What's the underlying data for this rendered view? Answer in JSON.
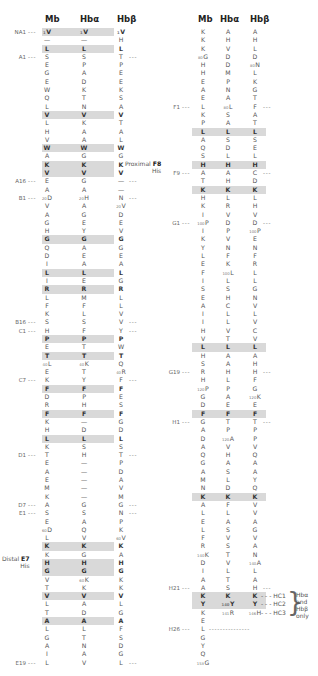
{
  "headers": {
    "mb": "Mb",
    "hba": "Hbα",
    "hbb": "Hbβ"
  },
  "left_rows": [
    {
      "label": "NA1",
      "mb": "V",
      "hba": "V",
      "hbb": "V",
      "shaded": true,
      "mb_num": "1",
      "hba_num": "1",
      "hbb_num": "1"
    },
    {
      "mb": "—",
      "hba": "—",
      "hbb": "H"
    },
    {
      "mb": "L",
      "hba": "L",
      "hbb": "L",
      "shaded": true
    },
    {
      "label": "A1",
      "mb": "S",
      "hba": "S",
      "hbb": "T",
      "right_dash": true
    },
    {
      "mb": "E",
      "hba": "P",
      "hbb": "P"
    },
    {
      "mb": "G",
      "hba": "A",
      "hbb": "E"
    },
    {
      "mb": "E",
      "hba": "D",
      "hbb": "E"
    },
    {
      "mb": "W",
      "hba": "K",
      "hbb": "K"
    },
    {
      "mb": "Q",
      "hba": "T",
      "hbb": "S"
    },
    {
      "mb": "L",
      "hba": "N",
      "hbb": "A"
    },
    {
      "mb": "V",
      "hba": "V",
      "hbb": "V",
      "shaded": true
    },
    {
      "mb": "L",
      "hba": "K",
      "hbb": "T"
    },
    {
      "mb": "H",
      "hba": "A",
      "hbb": "A"
    },
    {
      "mb": "V",
      "hba": "A",
      "hbb": "L"
    },
    {
      "mb": "W",
      "hba": "W",
      "hbb": "W",
      "shaded": true
    },
    {
      "mb": "A",
      "hba": "G",
      "hbb": "G"
    },
    {
      "mb": "K",
      "hba": "K",
      "hbb": "K",
      "shaded": true
    },
    {
      "mb": "V",
      "hba": "V",
      "hbb": "V",
      "shaded": true
    },
    {
      "label": "A16",
      "mb": "E",
      "hba": "G",
      "hbb": "—",
      "right_dash": true
    },
    {
      "mb": "A",
      "hba": "A",
      "hbb": "—"
    },
    {
      "label": "B1",
      "mb": "D",
      "hba": "H",
      "hbb": "N",
      "mb_num": "20",
      "hba_num": "20",
      "right_dash": true
    },
    {
      "mb": "V",
      "hba": "A",
      "hbb": "V",
      "hbb_num": "20"
    },
    {
      "mb": "A",
      "hba": "G",
      "hbb": "D"
    },
    {
      "mb": "G",
      "hba": "E",
      "hbb": "E"
    },
    {
      "mb": "H",
      "hba": "Y",
      "hbb": "V"
    },
    {
      "mb": "G",
      "hba": "G",
      "hbb": "G",
      "shaded": true
    },
    {
      "mb": "Q",
      "hba": "A",
      "hbb": "G"
    },
    {
      "mb": "D",
      "hba": "E",
      "hbb": "E"
    },
    {
      "mb": "I",
      "hba": "A",
      "hbb": "A"
    },
    {
      "mb": "L",
      "hba": "L",
      "hbb": "L",
      "shaded": true
    },
    {
      "mb": "I",
      "hba": "E",
      "hbb": "G"
    },
    {
      "mb": "R",
      "hba": "R",
      "hbb": "R",
      "shaded": true
    },
    {
      "mb": "L",
      "hba": "M",
      "hbb": "L"
    },
    {
      "mb": "F",
      "hba": "F",
      "hbb": "L"
    },
    {
      "mb": "K",
      "hba": "L",
      "hbb": "V"
    },
    {
      "label": "B16",
      "mb": "S",
      "hba": "S",
      "hbb": "V",
      "right_dash": true
    },
    {
      "label": "C1",
      "mb": "H",
      "hba": "F",
      "hbb": "Y",
      "right_dash": true
    },
    {
      "mb": "P",
      "hba": "P",
      "hbb": "P",
      "shaded": true
    },
    {
      "mb": "E",
      "hba": "T",
      "hbb": "W"
    },
    {
      "mb": "T",
      "hba": "T",
      "hbb": "T",
      "shaded": true
    },
    {
      "mb": "L",
      "hba": "K",
      "hbb": "Q",
      "mb_num": "40",
      "hba_num": "40"
    },
    {
      "mb": "E",
      "hba": "T",
      "hbb": "R",
      "hbb_num": "40"
    },
    {
      "label": "C7",
      "mb": "K",
      "hba": "Y",
      "hbb": "F",
      "right_dash": true
    },
    {
      "mb": "F",
      "hba": "F",
      "hbb": "F",
      "shaded": true
    },
    {
      "mb": "D",
      "hba": "P",
      "hbb": "E"
    },
    {
      "mb": "R",
      "hba": "H",
      "hbb": "S"
    },
    {
      "mb": "F",
      "hba": "F",
      "hbb": "F",
      "shaded": true
    },
    {
      "mb": "K",
      "hba": "—",
      "hbb": "G"
    },
    {
      "mb": "H",
      "hba": "D",
      "hbb": "D"
    },
    {
      "mb": "L",
      "hba": "L",
      "hbb": "L",
      "shaded": true
    },
    {
      "mb": "K",
      "hba": "S",
      "hbb": "S"
    },
    {
      "label": "D1",
      "mb": "T",
      "hba": "H",
      "hbb": "T",
      "right_dash": true
    },
    {
      "mb": "E",
      "hba": "—",
      "hbb": "P"
    },
    {
      "mb": "A",
      "hba": "—",
      "hbb": "D"
    },
    {
      "mb": "E",
      "hba": "—",
      "hbb": "A"
    },
    {
      "mb": "M",
      "hba": "—",
      "hbb": "V"
    },
    {
      "mb": "K",
      "hba": "—",
      "hbb": "M"
    },
    {
      "label": "D7",
      "mb": "A",
      "hba": "G",
      "hbb": "G",
      "right_dash": true
    },
    {
      "label": "E1",
      "mb": "S",
      "hba": "S",
      "hbb": "N",
      "right_dash": true
    },
    {
      "mb": "E",
      "hba": "A",
      "hbb": "P"
    },
    {
      "mb": "D",
      "hba": "Q",
      "hbb": "K",
      "mb_num": "60"
    },
    {
      "mb": "L",
      "hba": "V",
      "hbb": "V",
      "hbb_num": "60"
    },
    {
      "mb": "K",
      "hba": "K",
      "hbb": "K",
      "shaded": true
    },
    {
      "mb": "K",
      "hba": "G",
      "hbb": "A"
    },
    {
      "mb": "H",
      "hba": "H",
      "hbb": "H",
      "shaded": true,
      "special": "distal"
    },
    {
      "mb": "G",
      "hba": "G",
      "hbb": "G",
      "shaded": true
    },
    {
      "mb": "V",
      "hba": "K",
      "hbb": "K",
      "hba_num": "60"
    },
    {
      "mb": "T",
      "hba": "K",
      "hbb": "K"
    },
    {
      "mb": "V",
      "hba": "V",
      "hbb": "V",
      "shaded": true
    },
    {
      "mb": "L",
      "hba": "A",
      "hbb": "L"
    },
    {
      "mb": "T",
      "hba": "D",
      "hbb": "G"
    },
    {
      "mb": "A",
      "hba": "A",
      "hbb": "A",
      "shaded": true
    },
    {
      "mb": "L",
      "hba": "L",
      "hbb": "F"
    },
    {
      "mb": "G",
      "hba": "T",
      "hbb": "S"
    },
    {
      "mb": "A",
      "hba": "N",
      "hbb": "D"
    },
    {
      "mb": "I",
      "hba": "A",
      "hbb": "G"
    },
    {
      "label": "E19",
      "mb": "L",
      "hba": "V",
      "hbb": "L",
      "right_dash": true
    }
  ],
  "right_rows": [
    {
      "mb": "K",
      "hba": "A",
      "hbb": "A"
    },
    {
      "mb": "K",
      "hba": "H",
      "hbb": "H"
    },
    {
      "mb": "K",
      "hba": "V",
      "hbb": "L"
    },
    {
      "mb": "G",
      "hba": "D",
      "hbb": "D",
      "mb_num": "80"
    },
    {
      "mb": "H",
      "hba": "D",
      "hbb": "N",
      "hbb_num": "80"
    },
    {
      "mb": "H",
      "hba": "M",
      "hbb": "L"
    },
    {
      "mb": "E",
      "hba": "P",
      "hbb": "K"
    },
    {
      "mb": "A",
      "hba": "N",
      "hbb": "G"
    },
    {
      "mb": "E",
      "hba": "A",
      "hbb": "T"
    },
    {
      "label": "F1",
      "mb": "L",
      "hba": "L",
      "hbb": "F",
      "hba_num": "80",
      "right_dash": true
    },
    {
      "mb": "K",
      "hba": "S",
      "hbb": "A"
    },
    {
      "mb": "P",
      "hba": "A",
      "hbb": "T"
    },
    {
      "mb": "L",
      "hba": "L",
      "hbb": "L",
      "shaded": true
    },
    {
      "mb": "A",
      "hba": "S",
      "hbb": "S"
    },
    {
      "mb": "Q",
      "hba": "D",
      "hbb": "E"
    },
    {
      "mb": "S",
      "hba": "L",
      "hbb": "L"
    },
    {
      "mb": "H",
      "hba": "H",
      "hbb": "H",
      "shaded": true,
      "special": "proximal"
    },
    {
      "label": "F9",
      "mb": "A",
      "hba": "A",
      "hbb": "C",
      "right_dash": true
    },
    {
      "mb": "T",
      "hba": "H",
      "hbb": "D"
    },
    {
      "mb": "K",
      "hba": "K",
      "hbb": "K",
      "shaded": true
    },
    {
      "mb": "H",
      "hba": "L",
      "hbb": "L"
    },
    {
      "mb": "K",
      "hba": "R",
      "hbb": "H"
    },
    {
      "mb": "I",
      "hba": "V",
      "hbb": "V"
    },
    {
      "label": "G1",
      "mb": "P",
      "hba": "D",
      "hbb": "D",
      "mb_num": "100",
      "right_dash": true
    },
    {
      "mb": "I",
      "hba": "P",
      "hbb": "P",
      "hbb_num": "100"
    },
    {
      "mb": "K",
      "hba": "V",
      "hbb": "E"
    },
    {
      "mb": "Y",
      "hba": "N",
      "hbb": "N"
    },
    {
      "mb": "L",
      "hba": "F",
      "hbb": "F"
    },
    {
      "mb": "E",
      "hba": "K",
      "hbb": "R"
    },
    {
      "mb": "F",
      "hba": "L",
      "hbb": "L",
      "hba_num": "100"
    },
    {
      "mb": "I",
      "hba": "L",
      "hbb": "L"
    },
    {
      "mb": "S",
      "hba": "S",
      "hbb": "G"
    },
    {
      "mb": "E",
      "hba": "H",
      "hbb": "N"
    },
    {
      "mb": "A",
      "hba": "C",
      "hbb": "V"
    },
    {
      "mb": "I",
      "hba": "L",
      "hbb": "L"
    },
    {
      "mb": "I",
      "hba": "L",
      "hbb": "V"
    },
    {
      "mb": "H",
      "hba": "V",
      "hbb": "C"
    },
    {
      "mb": "V",
      "hba": "T",
      "hbb": "V"
    },
    {
      "mb": "L",
      "hba": "L",
      "hbb": "L",
      "shaded": true
    },
    {
      "mb": "H",
      "hba": "A",
      "hbb": "A"
    },
    {
      "mb": "S",
      "hba": "A",
      "hbb": "H"
    },
    {
      "label": "G19",
      "mb": "R",
      "hba": "H",
      "hbb": "H",
      "right_dash": true
    },
    {
      "mb": "H",
      "hba": "L",
      "hbb": "F"
    },
    {
      "mb": "P",
      "hba": "P",
      "hbb": "G",
      "mb_num": "120"
    },
    {
      "mb": "G",
      "hba": "A",
      "hbb": "K",
      "hbb_num": "120"
    },
    {
      "mb": "D",
      "hba": "E",
      "hbb": "E"
    },
    {
      "mb": "F",
      "hba": "F",
      "hbb": "F",
      "shaded": true
    },
    {
      "label": "H1",
      "mb": "G",
      "hba": "T",
      "hbb": "T",
      "right_dash": true
    },
    {
      "mb": "A",
      "hba": "P",
      "hbb": "P"
    },
    {
      "mb": "D",
      "hba": "A",
      "hbb": "P",
      "hba_num": "120"
    },
    {
      "mb": "A",
      "hba": "V",
      "hbb": "V"
    },
    {
      "mb": "Q",
      "hba": "H",
      "hbb": "Q"
    },
    {
      "mb": "G",
      "hba": "A",
      "hbb": "A"
    },
    {
      "mb": "A",
      "hba": "S",
      "hbb": "A"
    },
    {
      "mb": "M",
      "hba": "L",
      "hbb": "Y"
    },
    {
      "mb": "N",
      "hba": "D",
      "hbb": "Q"
    },
    {
      "mb": "K",
      "hba": "K",
      "hbb": "K",
      "shaded": true
    },
    {
      "mb": "A",
      "hba": "F",
      "hbb": "V"
    },
    {
      "mb": "L",
      "hba": "L",
      "hbb": "V"
    },
    {
      "mb": "E",
      "hba": "A",
      "hbb": "A"
    },
    {
      "mb": "L",
      "hba": "S",
      "hbb": "G"
    },
    {
      "mb": "F",
      "hba": "V",
      "hbb": "V"
    },
    {
      "mb": "R",
      "hba": "S",
      "hbb": "A"
    },
    {
      "mb": "K",
      "hba": "T",
      "hbb": "N",
      "mb_num": "140"
    },
    {
      "mb": "D",
      "hba": "V",
      "hbb": "A",
      "hbb_num": "140"
    },
    {
      "mb": "I",
      "hba": "L",
      "hbb": "L"
    },
    {
      "mb": "A",
      "hba": "T",
      "hbb": "A"
    },
    {
      "label": "H21",
      "mb": "A",
      "hba": "S",
      "hbb": "H",
      "right_dash": true
    },
    {
      "mb": "K",
      "hba": "K",
      "hbb": "K",
      "shaded": true,
      "hc": "HC1"
    },
    {
      "mb": "Y",
      "hba": "Y",
      "hbb": "Y",
      "shaded": true,
      "hba_num": "140",
      "hc": "HC2"
    },
    {
      "mb": "K",
      "hba": "R",
      "hbb": "H",
      "hba_num": "141",
      "hbb_num": "146",
      "hc": "HC3"
    },
    {
      "mb": "E",
      "hba": "",
      "hbb": ""
    },
    {
      "label": "H26",
      "mb": "L",
      "hba": "",
      "hbb": "",
      "long_dash": true
    },
    {
      "mb": "G",
      "hba": "",
      "hbb": ""
    },
    {
      "mb": "Y",
      "hba": "",
      "hbb": ""
    },
    {
      "mb": "Q",
      "hba": "",
      "hbb": ""
    },
    {
      "mb": "G",
      "hba": "",
      "hbb": "",
      "mb_num": "153"
    }
  ],
  "annotations": {
    "distal_line1": "Distal",
    "distal_line2": "His",
    "distal_code": "E7",
    "proximal_line1": "Proximal",
    "proximal_line2": "His",
    "proximal_code": "F8",
    "hc_note_line1": "Hbα",
    "hc_note_line2": "and",
    "hc_note_line3": "Hbβ",
    "hc_note_line4": "only"
  },
  "colors": {
    "shade": "#d9d9d9",
    "text": "#555555"
  }
}
